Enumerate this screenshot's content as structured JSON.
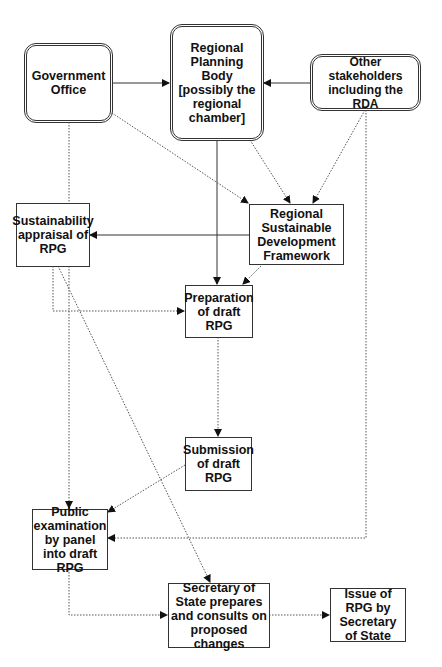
{
  "nodes": {
    "gov": {
      "label": "Government Office"
    },
    "rpb": {
      "label": "Regional Planning Body [possibly the regional chamber]"
    },
    "other": {
      "label": "Other stakeholders including the RDA"
    },
    "sa": {
      "label": "Sustainability appraisal of RPG"
    },
    "rsdf": {
      "label": "Regional Sustainable Development Framework"
    },
    "prep": {
      "label": "Preparation of draft RPG"
    },
    "sub": {
      "label": "Submission of draft RPG"
    },
    "pub": {
      "label": "Public examination by panel into draft RPG"
    },
    "sos": {
      "label": "Secretary of State prepares and consults on proposed changes"
    },
    "issue": {
      "label": "Issue of RPG by Secretary of State"
    }
  },
  "edges": [
    {
      "from": "gov",
      "to": "rpb",
      "style": "solid"
    },
    {
      "from": "other",
      "to": "rpb",
      "style": "solid"
    },
    {
      "from": "rpb",
      "to": "prep",
      "style": "solid"
    },
    {
      "from": "rsdf",
      "to": "sa",
      "style": "solid"
    },
    {
      "from": "gov",
      "to": "rsdf",
      "style": "dotted"
    },
    {
      "from": "rpb",
      "to": "rsdf",
      "style": "dotted"
    },
    {
      "from": "other",
      "to": "rsdf",
      "style": "dotted"
    },
    {
      "from": "rsdf",
      "to": "prep",
      "style": "dotted"
    },
    {
      "from": "sa",
      "to": "prep",
      "style": "dotted"
    },
    {
      "from": "sa",
      "to": "sos",
      "style": "dotted"
    },
    {
      "from": "prep",
      "to": "sub",
      "style": "dotted"
    },
    {
      "from": "sub",
      "to": "pub",
      "style": "dotted"
    },
    {
      "from": "gov",
      "to": "pub",
      "style": "dotted"
    },
    {
      "from": "other",
      "to": "pub",
      "style": "dotted"
    },
    {
      "from": "pub",
      "to": "sos",
      "style": "dotted"
    },
    {
      "from": "sos",
      "to": "issue",
      "style": "dotted"
    }
  ]
}
